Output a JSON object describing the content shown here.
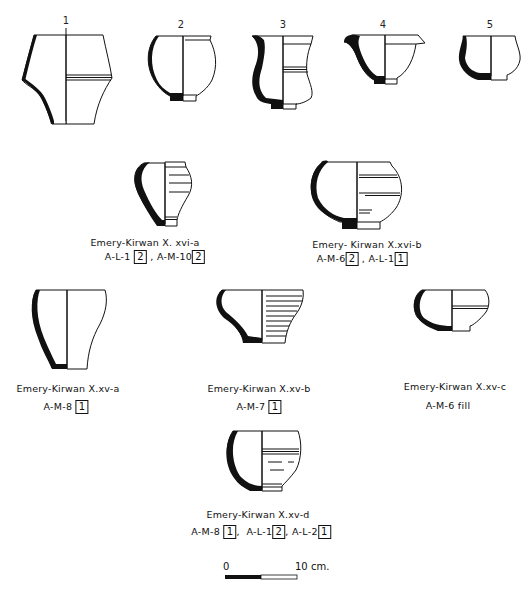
{
  "figure": {
    "top_row_numbers": [
      "1",
      "2",
      "3",
      "4",
      "5"
    ],
    "types": [
      {
        "caption": "Emery-Kirwan  X. xvi-a",
        "refs": [
          {
            "locus": "A-L-1",
            "count": "2"
          },
          {
            "locus": "A-M-10",
            "count": "2"
          }
        ]
      },
      {
        "caption": "Emery- Kirwan X.xvi-b",
        "refs": [
          {
            "locus": "A-M-6",
            "count": "2"
          },
          {
            "locus": "A-L-1",
            "count": "1"
          }
        ]
      },
      {
        "caption": "Emery-Kirwan  X.xv-a",
        "refs": [
          {
            "locus": "A-M-8",
            "count": "1"
          }
        ]
      },
      {
        "caption": "Emery-Kirwan X.xv-b",
        "refs": [
          {
            "locus": "A-M-7",
            "count": "1"
          }
        ]
      },
      {
        "caption": "Emery-Kirwan X.xv-c",
        "refs_text": "A-M-6  fill"
      },
      {
        "caption": "Emery-Kirwan X.xv-d",
        "refs": [
          {
            "locus": "A-M-8",
            "count": "1"
          },
          {
            "locus": "A-L-1",
            "count": "2"
          },
          {
            "locus": "A-L-2",
            "count": "1"
          }
        ]
      }
    ],
    "separator": ",",
    "scale_bar": {
      "start_label": "0",
      "end_label": "10 cm."
    }
  }
}
